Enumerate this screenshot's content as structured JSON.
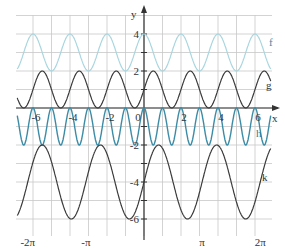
{
  "chart_data": {
    "type": "line",
    "title": "",
    "xlabel": "x",
    "ylabel": "y",
    "xlim": [
      -6.9,
      6.9
    ],
    "ylim": [
      -6.9,
      5.1
    ],
    "grid": true,
    "x_tick_labels": [
      "-6",
      "-4",
      "-2",
      "0",
      "2",
      "4",
      "6"
    ],
    "x_pi_labels": [
      "-2π",
      "-π",
      "π",
      "2π"
    ],
    "y_tick_labels": [
      "4",
      "2",
      "-2",
      "-4",
      "-6"
    ],
    "series": [
      {
        "name": "f",
        "formula": "3 + cos(πx)",
        "color": "#a9d6df",
        "max": 4,
        "min": 2,
        "period": 2
      },
      {
        "name": "g",
        "formula": "1 + sin(πx)",
        "color": "#3b3b3b",
        "max": 2,
        "min": 0,
        "period": 2
      },
      {
        "name": "h",
        "formula": "-1 + cos(2πx)",
        "color": "#3d8ca6",
        "max": 0,
        "min": -2,
        "period": 1
      },
      {
        "name": "k",
        "formula": "-4 + 2·sin(2x)",
        "color": "#3b3b3b",
        "max": -2,
        "min": -6,
        "period": 3.14159
      }
    ]
  },
  "labels": {
    "x_axis": "x",
    "y_axis": "y",
    "f": "f",
    "g": "g",
    "h": "h",
    "k": "k"
  }
}
